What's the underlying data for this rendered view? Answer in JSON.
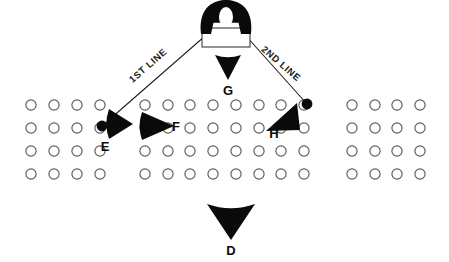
{
  "diagram": {
    "background_color": "#ffffff",
    "ink_color": "#0a0a0a",
    "circle_stroke_color": "#5b5b5b",
    "width": 449,
    "height": 262,
    "line_labels": [
      {
        "id": "line-1",
        "text": "1ST LINE",
        "x": 150,
        "y": 68,
        "rotation": -41
      },
      {
        "id": "line-2",
        "text": "2ND LINE",
        "x": 279,
        "y": 66,
        "rotation": 41
      }
    ],
    "routes": [
      {
        "id": "route-1st-line",
        "label": "1ST LINE",
        "x1": 205,
        "y1": 36,
        "x2": 102,
        "y2": 126
      },
      {
        "id": "route-2nd-line",
        "label": "2ND LINE",
        "x1": 246,
        "y1": 36,
        "x2": 307,
        "y2": 104
      }
    ],
    "dots": [
      {
        "id": "dot-e",
        "label": "E",
        "cx": 102,
        "cy": 126,
        "r": 5.4
      },
      {
        "id": "dot-h",
        "label": "H",
        "cx": 307,
        "cy": 104,
        "r": 5.4
      }
    ],
    "units": [
      {
        "id": "unit-g",
        "label": "G",
        "shape": "cone-down",
        "label_x": 228,
        "label_y": 95,
        "cone": {
          "apex_x": 228,
          "apex_y": 80,
          "base_y": 55,
          "half_width": 13
        }
      },
      {
        "id": "unit-d",
        "label": "D",
        "shape": "cone-down",
        "label_x": 231,
        "label_y": 255,
        "cone": {
          "apex_x": 231,
          "apex_y": 240,
          "base_y": 204,
          "half_width": 24
        }
      },
      {
        "id": "unit-e",
        "label": "E",
        "shape": "cone-right",
        "label_x": 105,
        "label_y": 151,
        "cone": {
          "apex_x": 133,
          "apex_y": 124,
          "base_x": 109,
          "half_height": 15
        }
      },
      {
        "id": "unit-f",
        "label": "F",
        "shape": "cone-right",
        "label_x": 176,
        "label_y": 131,
        "cone": {
          "apex_x": 174,
          "apex_y": 126,
          "base_x": 142,
          "half_height": 14
        }
      },
      {
        "id": "unit-h",
        "label": "H",
        "shape": "cone-up-right",
        "label_x": 274,
        "label_y": 138,
        "cone": {
          "apex_x": 297,
          "apex_y": 103,
          "p2x": 266,
          "p2y": 131,
          "p3x": 300,
          "p3y": 130
        }
      }
    ],
    "objective": {
      "id": "objective-box",
      "box": {
        "x": 202,
        "y": 28,
        "width": 48,
        "height": 19
      },
      "blob": {
        "cx": 226,
        "cy": 20,
        "rx": 25,
        "ry": 14
      },
      "blob_hole": {
        "cx": 226,
        "cy": 17,
        "rx": 7,
        "ry": 10
      }
    },
    "formation": {
      "rows": 4,
      "row_y": [
        105,
        128,
        151,
        174
      ],
      "circle_radius": 5.1,
      "groups": [
        {
          "id": "group-left",
          "columns": [
            31,
            54,
            77,
            100
          ]
        },
        {
          "id": "group-center",
          "columns": [
            145,
            168,
            190,
            213,
            236,
            259,
            281,
            304
          ]
        },
        {
          "id": "group-right",
          "columns": [
            352,
            375,
            397,
            420
          ]
        }
      ]
    }
  }
}
